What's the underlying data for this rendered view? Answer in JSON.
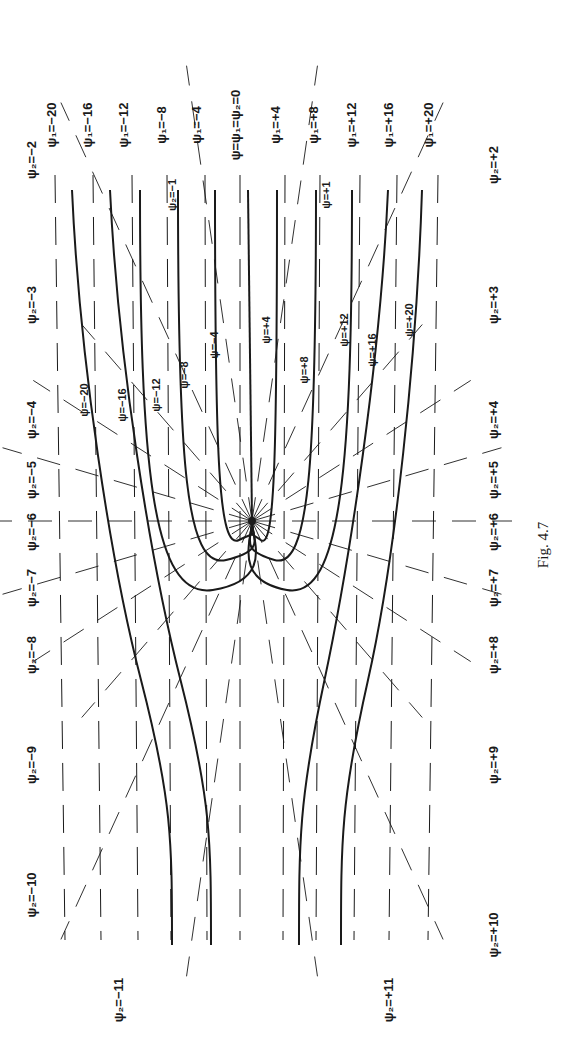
{
  "figure": {
    "caption": "Fig. 4.7",
    "rotation_deg": -90,
    "background": "#ffffff",
    "ink": "#1a1a1a",
    "source_point": {
      "x": 252,
      "y": 521
    }
  },
  "psi1_labels": [
    {
      "text": "ψ₁=−20",
      "x": 48,
      "y": 125
    },
    {
      "text": "ψ₁=−16",
      "x": 84,
      "y": 125
    },
    {
      "text": "ψ₁=−12",
      "x": 120,
      "y": 125
    },
    {
      "text": "ψ₁=−8",
      "x": 158,
      "y": 125
    },
    {
      "text": "ψ₁=−4",
      "x": 193,
      "y": 125
    },
    {
      "text": "ψ=ψ₁=ψ₂=0",
      "x": 232,
      "y": 125
    },
    {
      "text": "ψ₁=+4",
      "x": 272,
      "y": 125
    },
    {
      "text": "ψ₁=+8",
      "x": 310,
      "y": 125
    },
    {
      "text": "ψ₁=+12",
      "x": 348,
      "y": 125
    },
    {
      "text": "ψ₁=+16",
      "x": 385,
      "y": 125
    },
    {
      "text": "ψ₁=+20",
      "x": 425,
      "y": 125
    }
  ],
  "psi2_labels_left": [
    {
      "text": "ψ₂=−2",
      "x": 28,
      "y": 160
    },
    {
      "text": "ψ₂=−3",
      "x": 28,
      "y": 305
    },
    {
      "text": "ψ₂=−4",
      "x": 28,
      "y": 420
    },
    {
      "text": "ψ₂=−5",
      "x": 28,
      "y": 480
    },
    {
      "text": "ψ₂=−6",
      "x": 28,
      "y": 532
    },
    {
      "text": "ψ₂=−7",
      "x": 28,
      "y": 588
    },
    {
      "text": "ψ₂=−8",
      "x": 28,
      "y": 655
    },
    {
      "text": "ψ₂=−9",
      "x": 28,
      "y": 765
    },
    {
      "text": "ψ₂=−10",
      "x": 28,
      "y": 895
    },
    {
      "text": "ψ₂=−11",
      "x": 115,
      "y": 1000
    }
  ],
  "psi2_labels_right": [
    {
      "text": "ψ₂=+2",
      "x": 490,
      "y": 165
    },
    {
      "text": "ψ₂=+3",
      "x": 490,
      "y": 305
    },
    {
      "text": "ψ₂=+4",
      "x": 490,
      "y": 420
    },
    {
      "text": "ψ₂=+5",
      "x": 490,
      "y": 480
    },
    {
      "text": "ψ₂=+6",
      "x": 490,
      "y": 532
    },
    {
      "text": "ψ₂=+7",
      "x": 490,
      "y": 588
    },
    {
      "text": "ψ₂=+8",
      "x": 490,
      "y": 655
    },
    {
      "text": "ψ₂=+9",
      "x": 490,
      "y": 765
    },
    {
      "text": "ψ₂=+10",
      "x": 490,
      "y": 935
    },
    {
      "text": "ψ₂=+11",
      "x": 385,
      "y": 1000
    }
  ],
  "psi_inline_labels": [
    {
      "text": "ψ₂=−1",
      "x": 168,
      "y": 195
    },
    {
      "text": "ψ=+1",
      "x": 322,
      "y": 195
    },
    {
      "text": "ψ=−20",
      "x": 80,
      "y": 400
    },
    {
      "text": "ψ=−16",
      "x": 118,
      "y": 405
    },
    {
      "text": "ψ=−12",
      "x": 152,
      "y": 395
    },
    {
      "text": "ψ=−8",
      "x": 180,
      "y": 375
    },
    {
      "text": "ψ=−4",
      "x": 210,
      "y": 345
    },
    {
      "text": "ψ=+4",
      "x": 262,
      "y": 330
    },
    {
      "text": "ψ=+8",
      "x": 300,
      "y": 370
    },
    {
      "text": "ψ=+12",
      "x": 340,
      "y": 330
    },
    {
      "text": "ψ=+16",
      "x": 368,
      "y": 350
    },
    {
      "text": "ψ=+20",
      "x": 405,
      "y": 320
    }
  ],
  "streamlines": [
    {
      "name": "psi-minus-20",
      "top_x": 72,
      "mid_x": 110,
      "bottom_x": 172,
      "type": "open"
    },
    {
      "name": "psi-minus-16",
      "top_x": 110,
      "mid_x": 150,
      "bottom_x": 211,
      "type": "open"
    },
    {
      "name": "psi-minus-12",
      "top_x": 140,
      "loop_bottom_y": 590,
      "type": "loop"
    },
    {
      "name": "psi-minus-8",
      "top_x": 178,
      "loop_bottom_y": 560,
      "type": "loop"
    },
    {
      "name": "psi-minus-4",
      "top_x": 215,
      "loop_bottom_y": 540,
      "type": "loop"
    },
    {
      "name": "psi-zero",
      "top_x": 248,
      "type": "axis"
    },
    {
      "name": "psi-plus-4",
      "top_x": 277,
      "loop_bottom_y": 540,
      "type": "loop"
    },
    {
      "name": "psi-plus-8",
      "top_x": 316,
      "loop_bottom_y": 560,
      "type": "loop"
    },
    {
      "name": "psi-plus-12",
      "top_x": 352,
      "loop_bottom_y": 590,
      "type": "loop"
    },
    {
      "name": "psi-plus-16",
      "top_x": 388,
      "mid_x": 350,
      "bottom_x": 299,
      "type": "open"
    },
    {
      "name": "psi-plus-20",
      "top_x": 422,
      "mid_x": 395,
      "bottom_x": 341,
      "type": "open"
    }
  ],
  "uniform_flow_lines_x": [
    55,
    93,
    132,
    167,
    205,
    240,
    285,
    320,
    360,
    397,
    438
  ],
  "radial_line_count": 22
}
